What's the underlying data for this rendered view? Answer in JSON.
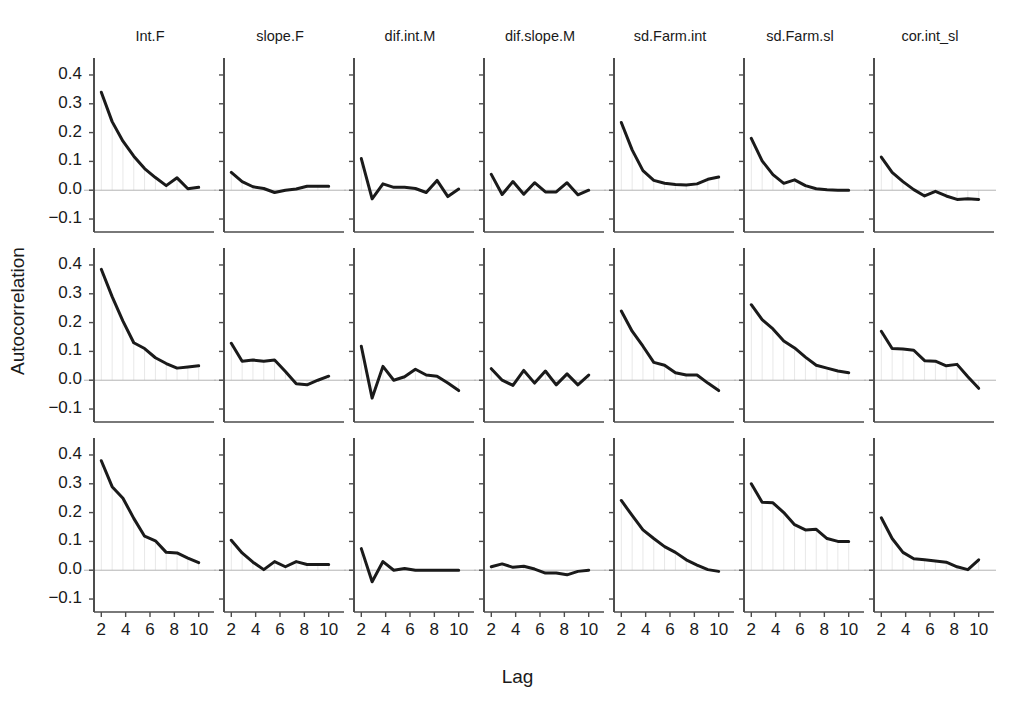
{
  "chart_data": {
    "type": "line",
    "title": "",
    "xlabel": "Lag",
    "ylabel": "Autocorrelation",
    "grid": false,
    "legend": "none",
    "layout": {
      "rows": 3,
      "cols": 7,
      "shared_x": true,
      "shared_y": true
    },
    "x": [
      2,
      3,
      4,
      5,
      6,
      7,
      8,
      9,
      10
    ],
    "xlim": [
      1.4,
      10.6
    ],
    "ylim": [
      -0.145,
      0.445
    ],
    "xticks": [
      2,
      4,
      6,
      8,
      10
    ],
    "xtick_labels": [
      "2",
      "4",
      "6",
      "8",
      "10"
    ],
    "yticks": [
      0.4,
      0.3,
      0.2,
      0.1,
      0.0,
      -0.1
    ],
    "ytick_labels": [
      "0.4",
      "0.3",
      "0.2",
      "0.1",
      "0.0",
      "-0.1"
    ],
    "zero_line": 0.0,
    "column_titles": [
      "Int.F",
      "slope.F",
      "dif.int.M",
      "dif.slope.M",
      "sd.Farm.int",
      "sd.Farm.sl",
      "cor.int_sl"
    ],
    "row_labels": [
      "",
      "",
      ""
    ],
    "line_color": "#1a1a1a",
    "zero_line_color": "#b4b4b4",
    "axis_color": "#555555",
    "panels": [
      {
        "row": 0,
        "col": 0,
        "title": "Int.F",
        "values": [
          0.34,
          0.238,
          0.17,
          0.118,
          0.075,
          0.044,
          0.016,
          0.043,
          0.005,
          0.01
        ]
      },
      {
        "row": 0,
        "col": 1,
        "title": "slope.F",
        "values": [
          0.062,
          0.03,
          0.012,
          0.006,
          -0.008,
          0.0,
          0.004,
          0.014,
          0.014,
          0.014
        ]
      },
      {
        "row": 0,
        "col": 2,
        "title": "dif.int.M",
        "values": [
          0.11,
          -0.03,
          0.022,
          0.01,
          0.01,
          0.006,
          -0.008,
          0.034,
          -0.022,
          0.004
        ]
      },
      {
        "row": 0,
        "col": 3,
        "title": "dif.slope.M",
        "values": [
          0.055,
          -0.015,
          0.03,
          -0.014,
          0.026,
          -0.006,
          -0.006,
          0.026,
          -0.016,
          0.0
        ]
      },
      {
        "row": 0,
        "col": 4,
        "title": "sd.Farm.int",
        "values": [
          0.235,
          0.14,
          0.068,
          0.034,
          0.024,
          0.02,
          0.018,
          0.022,
          0.038,
          0.046
        ]
      },
      {
        "row": 0,
        "col": 5,
        "title": "sd.Farm.sl",
        "values": [
          0.18,
          0.102,
          0.054,
          0.024,
          0.036,
          0.016,
          0.005,
          0.002,
          0.0,
          0.0
        ]
      },
      {
        "row": 0,
        "col": 6,
        "title": "cor.int_sl",
        "values": [
          0.115,
          0.062,
          0.03,
          0.002,
          -0.02,
          -0.004,
          -0.02,
          -0.032,
          -0.03,
          -0.032
        ]
      },
      {
        "row": 1,
        "col": 0,
        "title": "Int.F",
        "values": [
          0.385,
          0.29,
          0.205,
          0.13,
          0.11,
          0.078,
          0.058,
          0.042,
          0.046,
          0.05
        ]
      },
      {
        "row": 1,
        "col": 1,
        "title": "slope.F",
        "values": [
          0.128,
          0.066,
          0.07,
          0.066,
          0.07,
          0.03,
          -0.012,
          -0.016,
          0.0,
          0.014
        ]
      },
      {
        "row": 1,
        "col": 2,
        "title": "dif.int.M",
        "values": [
          0.118,
          -0.062,
          0.048,
          0.0,
          0.012,
          0.038,
          0.018,
          0.014,
          -0.01,
          -0.036
        ]
      },
      {
        "row": 1,
        "col": 3,
        "title": "dif.slope.M",
        "values": [
          0.04,
          0.0,
          -0.018,
          0.034,
          -0.01,
          0.032,
          -0.016,
          0.022,
          -0.016,
          0.018
        ]
      },
      {
        "row": 1,
        "col": 4,
        "title": "sd.Farm.int",
        "values": [
          0.24,
          0.17,
          0.118,
          0.062,
          0.052,
          0.026,
          0.018,
          0.018,
          -0.01,
          -0.036
        ]
      },
      {
        "row": 1,
        "col": 5,
        "title": "sd.Farm.sl",
        "values": [
          0.262,
          0.21,
          0.178,
          0.136,
          0.112,
          0.08,
          0.052,
          0.042,
          0.032,
          0.026
        ]
      },
      {
        "row": 1,
        "col": 6,
        "title": "cor.int_sl",
        "values": [
          0.17,
          0.11,
          0.108,
          0.104,
          0.068,
          0.066,
          0.05,
          0.055,
          0.012,
          -0.028
        ]
      },
      {
        "row": 2,
        "col": 0,
        "title": "Int.F",
        "values": [
          0.38,
          0.29,
          0.25,
          0.18,
          0.118,
          0.102,
          0.062,
          0.06,
          0.042,
          0.026
        ]
      },
      {
        "row": 2,
        "col": 1,
        "title": "slope.F",
        "values": [
          0.104,
          0.06,
          0.028,
          0.002,
          0.03,
          0.012,
          0.03,
          0.02,
          0.02,
          0.02
        ]
      },
      {
        "row": 2,
        "col": 2,
        "title": "dif.int.M",
        "values": [
          0.075,
          -0.04,
          0.03,
          0.0,
          0.006,
          0.0,
          0.0,
          0.0,
          0.0,
          0.0
        ]
      },
      {
        "row": 2,
        "col": 3,
        "title": "dif.slope.M",
        "values": [
          0.012,
          0.022,
          0.01,
          0.014,
          0.004,
          -0.01,
          -0.01,
          -0.016,
          -0.004,
          0.0
        ]
      },
      {
        "row": 2,
        "col": 4,
        "title": "sd.Farm.int",
        "values": [
          0.242,
          0.19,
          0.14,
          0.11,
          0.082,
          0.062,
          0.036,
          0.018,
          0.002,
          -0.004
        ]
      },
      {
        "row": 2,
        "col": 5,
        "title": "sd.Farm.sl",
        "values": [
          0.3,
          0.236,
          0.234,
          0.2,
          0.158,
          0.14,
          0.142,
          0.11,
          0.1,
          0.1
        ]
      },
      {
        "row": 2,
        "col": 6,
        "title": "cor.int_sl",
        "values": [
          0.182,
          0.11,
          0.062,
          0.04,
          0.036,
          0.032,
          0.028,
          0.012,
          0.002,
          0.036
        ]
      }
    ]
  }
}
